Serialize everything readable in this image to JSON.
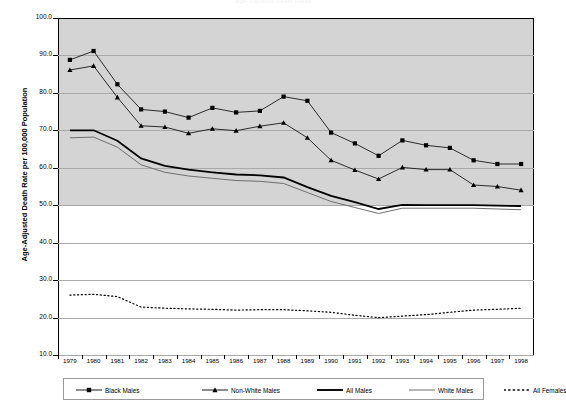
{
  "chart": {
    "title": "Age-Adjusted Death Rates",
    "y_axis_title": "Age-Adjusted Death Rate per 100,000 Population",
    "y_ticks": [
      "100.0",
      "90.0",
      "80.0",
      "70.0",
      "60.0",
      "50.0",
      "40.0",
      "30.0",
      "20.0",
      "10.0"
    ],
    "x_ticks": [
      "1979",
      "1980",
      "1981",
      "1982",
      "1983",
      "1984",
      "1985",
      "1986",
      "1987",
      "1988",
      "1989",
      "1990",
      "1991",
      "1992",
      "1993",
      "1994",
      "1995",
      "1996",
      "1997",
      "1998"
    ]
  },
  "legend": {
    "items": [
      {
        "label": "Black Males",
        "marker": "square-marker-line",
        "color": "#000000"
      },
      {
        "label": "Non-White Males",
        "marker": "triangle-marker-line",
        "color": "#000000"
      },
      {
        "label": "All Males",
        "marker": "thick-line",
        "color": "#000000"
      },
      {
        "label": "White Males",
        "marker": "thin-line",
        "color": "#6e6e6e"
      },
      {
        "label": "All Females",
        "marker": "dotted-line",
        "color": "#000000"
      }
    ]
  },
  "chart_data": {
    "type": "line",
    "title": "Age-Adjusted Death Rates",
    "xlabel": "",
    "ylabel": "Age-Adjusted Death Rate per 100,000 Population",
    "ylim": [
      10.0,
      100.0
    ],
    "ytick_step": 10.0,
    "grid": true,
    "legend_position": "bottom",
    "x": [
      1979,
      1980,
      1981,
      1982,
      1983,
      1984,
      1985,
      1986,
      1987,
      1988,
      1989,
      1990,
      1991,
      1992,
      1993,
      1994,
      1995,
      1996,
      1997,
      1998
    ],
    "series": [
      {
        "name": "Black Males",
        "marker": "square",
        "color": "#000000",
        "values": [
          88.8,
          91.2,
          82.3,
          75.6,
          75.0,
          73.4,
          76.0,
          74.8,
          75.2,
          79.0,
          77.9,
          69.4,
          66.5,
          63.2,
          67.3,
          66.0,
          65.3,
          62.0,
          61.0,
          61.0
        ]
      },
      {
        "name": "Non-White Males",
        "marker": "triangle",
        "color": "#000000",
        "values": [
          86.1,
          87.2,
          78.8,
          71.2,
          70.9,
          69.2,
          70.4,
          69.9,
          71.1,
          72.0,
          68.0,
          62.0,
          59.4,
          57.0,
          60.1,
          59.5,
          59.5,
          55.4,
          55.0,
          54.0
        ]
      },
      {
        "name": "All Males",
        "marker": "none",
        "color": "#000000",
        "values": [
          70.0,
          70.0,
          67.2,
          62.5,
          60.5,
          59.5,
          58.8,
          58.2,
          58.0,
          57.4,
          54.8,
          52.5,
          50.8,
          49.0,
          50.1,
          50.0,
          50.0,
          50.0,
          49.9,
          49.8
        ]
      },
      {
        "name": "White Males",
        "marker": "none",
        "color": "#6e6e6e",
        "values": [
          68.0,
          68.2,
          65.5,
          60.8,
          58.8,
          57.8,
          57.2,
          56.6,
          56.4,
          55.8,
          53.4,
          51.0,
          49.4,
          47.8,
          49.2,
          49.2,
          49.2,
          49.2,
          49.0,
          48.8
        ]
      },
      {
        "name": "All Females",
        "marker": "none",
        "color": "#000000",
        "values": [
          26.0,
          26.2,
          25.6,
          22.8,
          22.5,
          22.3,
          22.2,
          22.0,
          22.1,
          22.1,
          21.8,
          21.4,
          20.6,
          20.0,
          20.4,
          20.8,
          21.4,
          22.0,
          22.2,
          22.5
        ]
      }
    ]
  }
}
